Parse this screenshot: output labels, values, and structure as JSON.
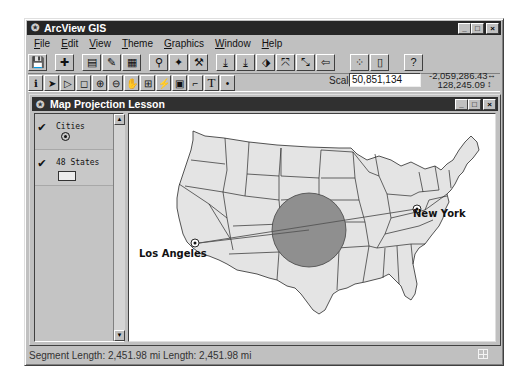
{
  "app": {
    "title": "ArcView GIS",
    "window_buttons": {
      "minimize": "_",
      "maximize": "□",
      "close": "×"
    }
  },
  "menu": [
    {
      "label": "File",
      "accel": "F"
    },
    {
      "label": "Edit",
      "accel": "E"
    },
    {
      "label": "View",
      "accel": "V"
    },
    {
      "label": "Theme",
      "accel": "T"
    },
    {
      "label": "Graphics",
      "accel": "G"
    },
    {
      "label": "Window",
      "accel": "W"
    },
    {
      "label": "Help",
      "accel": "H"
    }
  ],
  "toolbar_buttons": [
    {
      "name": "save-project",
      "glyph": "💾"
    },
    {
      "name": "add-theme",
      "glyph": "✚"
    },
    {
      "name": "theme-properties",
      "glyph": "▤"
    },
    {
      "name": "edit-legend",
      "glyph": "✎"
    },
    {
      "name": "open-theme-table",
      "glyph": "▦"
    },
    {
      "name": "find",
      "glyph": "⚲"
    },
    {
      "name": "locate-address",
      "glyph": "✦"
    },
    {
      "name": "query-builder",
      "glyph": "⚒"
    },
    {
      "name": "zoom-to-full-extent",
      "glyph": "⤓"
    },
    {
      "name": "zoom-to-active-themes",
      "glyph": "⤓"
    },
    {
      "name": "zoom-to-selected",
      "glyph": "⬗"
    },
    {
      "name": "zoom-in",
      "glyph": "⤧"
    },
    {
      "name": "zoom-out",
      "glyph": "⤡"
    },
    {
      "name": "zoom-previous",
      "glyph": "⇦"
    },
    {
      "name": "select-features-graphic",
      "glyph": "⁘"
    },
    {
      "name": "clear-selected",
      "glyph": "▯"
    },
    {
      "name": "help",
      "glyph": "?"
    }
  ],
  "tools": [
    {
      "name": "identify",
      "glyph": "ℹ"
    },
    {
      "name": "pointer",
      "glyph": "➤"
    },
    {
      "name": "vertex-edit",
      "glyph": "▷"
    },
    {
      "name": "select-feature",
      "glyph": "◻"
    },
    {
      "name": "zoom-in-tool",
      "glyph": "⊕"
    },
    {
      "name": "zoom-out-tool",
      "glyph": "⊖"
    },
    {
      "name": "pan",
      "glyph": "✋"
    },
    {
      "name": "measure",
      "glyph": "⊞"
    },
    {
      "name": "hot-link",
      "glyph": "⚡"
    },
    {
      "name": "area-of-interest",
      "glyph": "▣"
    },
    {
      "name": "label",
      "glyph": "⌐"
    },
    {
      "name": "text",
      "glyph": "T"
    },
    {
      "name": "draw-point",
      "glyph": "•"
    }
  ],
  "scale": {
    "label": "Scale 1:",
    "value": "50,851,134"
  },
  "coordinates": {
    "x": "-2,059,286.43",
    "y": "128,245.09",
    "x_arrow": "↔",
    "y_arrow": "↕"
  },
  "view": {
    "title": "Map Projection Lesson",
    "themes": [
      {
        "name": "Cities",
        "visible": true,
        "symbol": "point"
      },
      {
        "name": "48 States",
        "visible": true,
        "symbol": "polygon"
      }
    ],
    "check_glyph": "✔",
    "scroll_up": "▲",
    "scroll_down": "▼"
  },
  "map": {
    "cities": [
      {
        "name": "Los Angeles"
      },
      {
        "name": "New York"
      }
    ],
    "state_fill": "#e4e4e4",
    "circle_fill": "#8f8f8f",
    "line_color": "#555555"
  },
  "status": {
    "text": "Segment Length: 2,451.98 mi  Length: 2,451.98 mi"
  }
}
